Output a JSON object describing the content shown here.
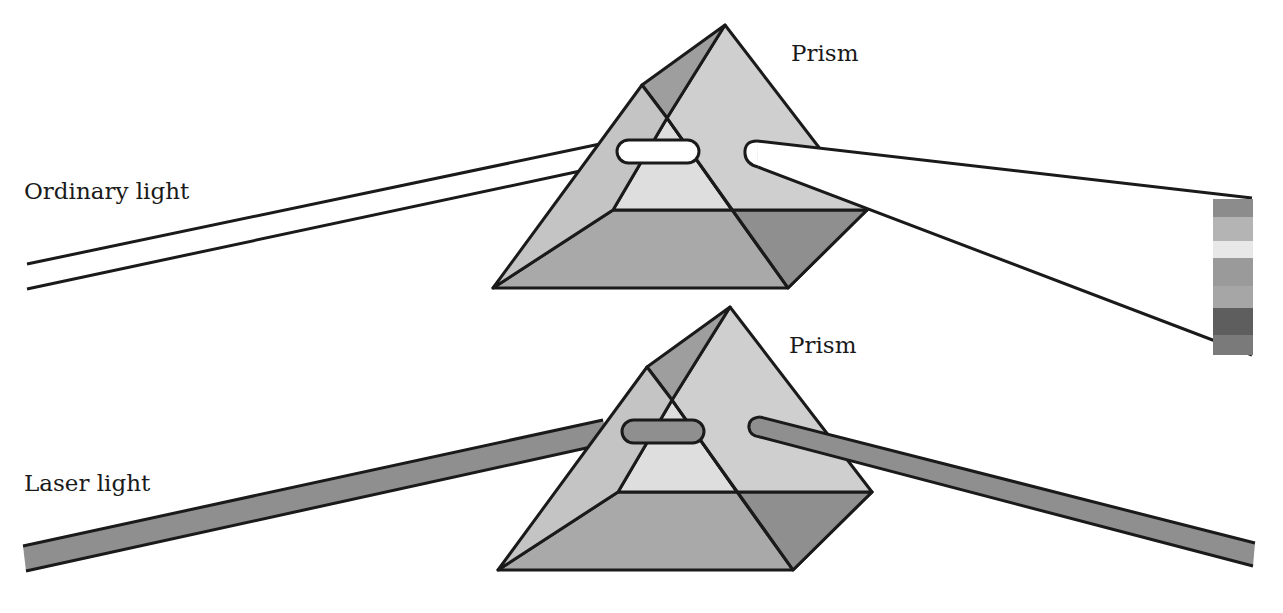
{
  "diagram": {
    "type": "physics-illustration",
    "colors": {
      "outline": "#1a1a1a",
      "prism_light": "#d9d9d9",
      "prism_mid": "#bdbdbd",
      "prism_dark": "#9c9c9c",
      "prism_darkest": "#8a8a8a",
      "laser_beam": "#8f8f8f",
      "background": "#ffffff"
    },
    "top_panel": {
      "beam_label": "Ordinary light",
      "prism_label": "Prism",
      "output": "dispersed spectrum",
      "spectrum_bands": [
        "#8c8c8c",
        "#b4b4b4",
        "#e8e8e8",
        "#9a9a9a",
        "#a6a6a6",
        "#5e5e5e",
        "#7a7a7a"
      ]
    },
    "bottom_panel": {
      "beam_label": "Laser light",
      "prism_label": "Prism",
      "output": "single undispersed beam"
    }
  }
}
